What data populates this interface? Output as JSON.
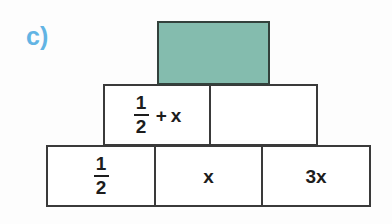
{
  "page": {
    "background_color": "#fdfdfd",
    "width": 392,
    "height": 224
  },
  "exercise": {
    "label": "c)",
    "label_color": "#62b4e4"
  },
  "pyramid": {
    "type": "number-pyramid",
    "border_color": "#3a3a3a",
    "highlight_color": "#84bcae",
    "rows": [
      {
        "row_index": 0,
        "name": "top-row",
        "cells": [
          {
            "id": "top-block",
            "content": "",
            "filled": true,
            "fill_color": "#84bcae",
            "is_answer_blank": true
          }
        ]
      },
      {
        "row_index": 1,
        "name": "middle-row",
        "cells": [
          {
            "id": "mid-left",
            "content": "1/2 + x",
            "numerator": "1",
            "denominator": "2",
            "operator": "+",
            "variable": "x",
            "filled": false,
            "is_answer_blank": false
          },
          {
            "id": "mid-right",
            "content": "",
            "filled": false,
            "is_answer_blank": true
          }
        ]
      },
      {
        "row_index": 2,
        "name": "bottom-row",
        "cells": [
          {
            "id": "bot-left",
            "content": "1/2",
            "numerator": "1",
            "denominator": "2",
            "filled": false,
            "is_answer_blank": false
          },
          {
            "id": "bot-mid",
            "content": "x",
            "filled": false,
            "is_answer_blank": false
          },
          {
            "id": "bot-right",
            "content": "3x",
            "filled": false,
            "is_answer_blank": false
          }
        ]
      }
    ]
  }
}
